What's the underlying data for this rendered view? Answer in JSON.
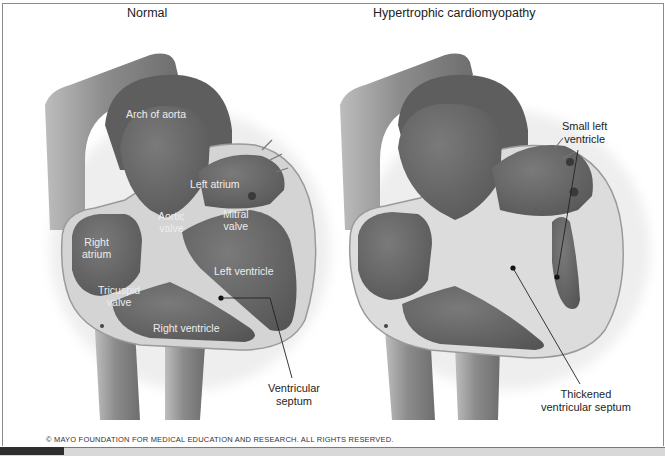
{
  "figure": {
    "panels": [
      {
        "title": "Normal",
        "inner_labels": [
          {
            "text": "Arch of aorta",
            "x": 126,
            "y": 108
          },
          {
            "text": "Left atrium",
            "x": 190,
            "y": 178
          },
          {
            "text": "Aortic\nvalve",
            "x": 158,
            "y": 210
          },
          {
            "text": "Mitral\nvalve",
            "x": 223,
            "y": 208
          },
          {
            "text": "Right\natrium",
            "x": 82,
            "y": 236
          },
          {
            "text": "Left ventricle",
            "x": 214,
            "y": 265
          },
          {
            "text": "Tricuspid\nvalve",
            "x": 98,
            "y": 284
          },
          {
            "text": "Right ventricle",
            "x": 153,
            "y": 322
          }
        ],
        "callouts": [
          {
            "text": "Ventricular\nseptum",
            "x": 268,
            "y": 382
          }
        ]
      },
      {
        "title": "Hypertrophic cardiomyopathy",
        "inner_labels": [],
        "callouts": [
          {
            "text": "Small left\nventricle",
            "x": 562,
            "y": 120
          },
          {
            "text": "Thickened\nventricular septum",
            "x": 541,
            "y": 388
          }
        ]
      }
    ],
    "copyright": "© MAYO FOUNDATION FOR MEDICAL EDUCATION AND RESEARCH. ALL RIGHTS RESERVED."
  },
  "colors": {
    "chamber": "#6b6b6b",
    "wall": "#dadada",
    "vessel": "#8e8e8e",
    "label_light": "#ededed",
    "label_dark": "#1e1e1e"
  }
}
